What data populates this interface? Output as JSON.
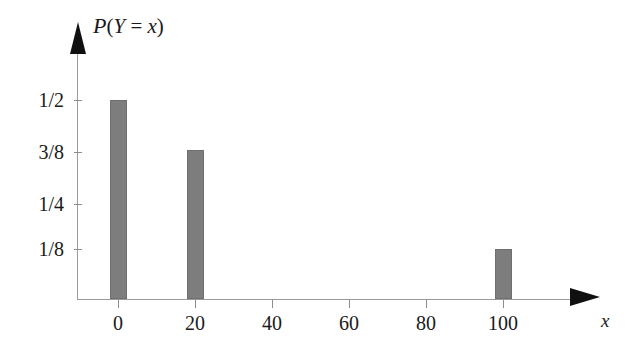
{
  "chart_data": {
    "type": "bar",
    "title": "",
    "subtitle": "",
    "ylabel": "P(Y = x)",
    "ylabel_parts": {
      "script_p": "P",
      "open_paren": "(",
      "random_var": "Y",
      "equals": " = ",
      "value_var": "x",
      "close_paren": ")"
    },
    "xlabel": "x",
    "categories": [
      "0",
      "20",
      "40",
      "60",
      "80",
      "100"
    ],
    "x": [
      0,
      20,
      40,
      60,
      80,
      100
    ],
    "values": [
      0.5,
      0.375,
      0,
      0,
      0,
      0.125
    ],
    "value_labels": [
      "1/2",
      "3/8",
      "0",
      "0",
      "0",
      "1/8"
    ],
    "bars": [
      {
        "x": 0,
        "value": 0.5,
        "value_label": "1/2"
      },
      {
        "x": 20,
        "value": 0.375,
        "value_label": "3/8"
      },
      {
        "x": 100,
        "value": 0.125,
        "value_label": "1/8"
      }
    ],
    "ytick_labels": [
      "1/2",
      "3/8",
      "1/4",
      "1/8"
    ],
    "ytick_values": [
      0.5,
      0.375,
      0.25,
      0.125
    ],
    "xtick_labels": [
      "0",
      "20",
      "40",
      "60",
      "80",
      "100"
    ],
    "xlim": [
      -10,
      115
    ],
    "ylim": [
      0,
      0.58
    ],
    "grid": false,
    "legend": null,
    "bar_color": "#7d7d7d",
    "axis_color": "#9a9a9a",
    "arrow_color": "#101010",
    "background_color": "#ffffff"
  },
  "axes": {
    "y_title": "P(Y = x)",
    "x_title": "x"
  },
  "yticks": [
    {
      "label": "1/2"
    },
    {
      "label": "3/8"
    },
    {
      "label": "1/4"
    },
    {
      "label": "1/8"
    }
  ],
  "xticks": [
    {
      "label": "0"
    },
    {
      "label": "20"
    },
    {
      "label": "40"
    },
    {
      "label": "60"
    },
    {
      "label": "80"
    },
    {
      "label": "100"
    }
  ]
}
